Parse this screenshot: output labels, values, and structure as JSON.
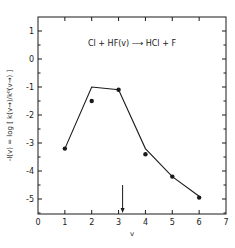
{
  "chart_data": {
    "type": "line",
    "title": "",
    "annotation": "Cl + HF(v) ⟶ HCl + F",
    "xlabel": "v",
    "ylabel": "-I(v) = log [ k(v→)/k⁰(v→) ]",
    "xlim": [
      0,
      7
    ],
    "ylim": [
      -5.55,
      1.5
    ],
    "x_ticks": [
      0,
      1,
      2,
      3,
      4,
      5,
      6,
      7
    ],
    "x_tick_labels": [
      "0",
      "1",
      "2",
      "3",
      "4",
      "5",
      "6",
      "7"
    ],
    "y_ticks": [
      1,
      0,
      -1,
      -2,
      -3,
      -4,
      -5
    ],
    "y_tick_labels": [
      "1",
      "0",
      "-1",
      "-2",
      "-3",
      "-4",
      "-5"
    ],
    "y_minor_step": 0.5,
    "grid": false,
    "series": [
      {
        "name": "calculated",
        "style": "line",
        "x": [
          1,
          2,
          3,
          4,
          5,
          6
        ],
        "y": [
          -3.2,
          -1.0,
          -1.1,
          -3.2,
          -4.2,
          -4.9
        ]
      },
      {
        "name": "experimental",
        "style": "points",
        "x": [
          1,
          2,
          3,
          4,
          5,
          6
        ],
        "y": [
          -3.2,
          -1.5,
          -1.1,
          -3.4,
          -4.2,
          -4.95
        ]
      }
    ],
    "marker": {
      "type": "down-arrow",
      "x": 3.15,
      "y_from": -4.5,
      "y_to": -5.55
    },
    "colors": {
      "ink": "#1a1a1a",
      "background": "#ffffff"
    }
  }
}
